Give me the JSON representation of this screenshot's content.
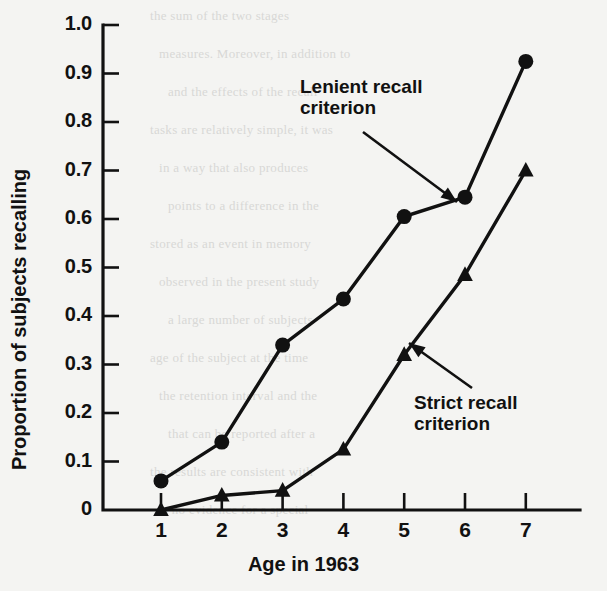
{
  "figure": {
    "background_color": "#f4f4f2",
    "ink_color": "#111111",
    "bleed_through_lines": [
      "the  sum  of  the  two  stages",
      "measures.  Moreover,  in  addition  to",
      "and  the  effects  of  the  recall",
      "tasks  are  relatively  simple,  it  was",
      "in  a  way  that  also  produces",
      "points  to  a  difference  in  the",
      "stored  as  an  event  in  memory",
      "observed  in  the  present  study",
      "a  large  number  of  subjects",
      "age  of  the  subject  at  the  time",
      "the  retention  interval  and  the",
      "that  can  be  reported  after  a",
      "the  results  are  consistent  with",
      "is  no  evidence  for  a  special"
    ]
  },
  "chart_data": {
    "type": "line",
    "title": "",
    "xlabel": "Age in 1963",
    "ylabel": "Proportion of subjects recalling",
    "x": [
      1,
      2,
      3,
      4,
      5,
      6,
      7
    ],
    "xticklabels": [
      "1",
      "2",
      "3",
      "4",
      "5",
      "6",
      "7"
    ],
    "yticks": [
      0,
      0.1,
      0.2,
      0.3,
      0.4,
      0.5,
      0.6,
      0.7,
      0.8,
      0.9,
      1.0
    ],
    "yticklabels": [
      "0",
      "0.1",
      "0.2",
      "0.3",
      "0.4",
      "0.5",
      "0.6",
      "0.7",
      "0.8",
      "0.9",
      "1.0"
    ],
    "xlim": [
      0.6,
      7.6
    ],
    "ylim": [
      0,
      1.0
    ],
    "grid": false,
    "legend_position": "inline-annotations",
    "series": [
      {
        "name": "Lenient recall criterion",
        "marker": "circle",
        "values": [
          0.06,
          0.14,
          0.34,
          0.435,
          0.605,
          0.645,
          0.925
        ]
      },
      {
        "name": "Strict recall criterion",
        "marker": "triangle",
        "values": [
          0.0,
          0.03,
          0.04,
          0.125,
          0.32,
          0.485,
          0.7
        ]
      }
    ],
    "annotations": [
      {
        "text": "Lenient recall\ncriterion",
        "label_x": 300,
        "label_y": 76,
        "arrow_from_x": 363,
        "arrow_from_y": 132,
        "arrow_to_x": 457,
        "arrow_to_y": 202
      },
      {
        "text": "Strict recall\ncriterion",
        "label_x": 414,
        "label_y": 392,
        "arrow_from_x": 472,
        "arrow_from_y": 388,
        "arrow_to_x": 409,
        "arrow_to_y": 343
      }
    ]
  }
}
